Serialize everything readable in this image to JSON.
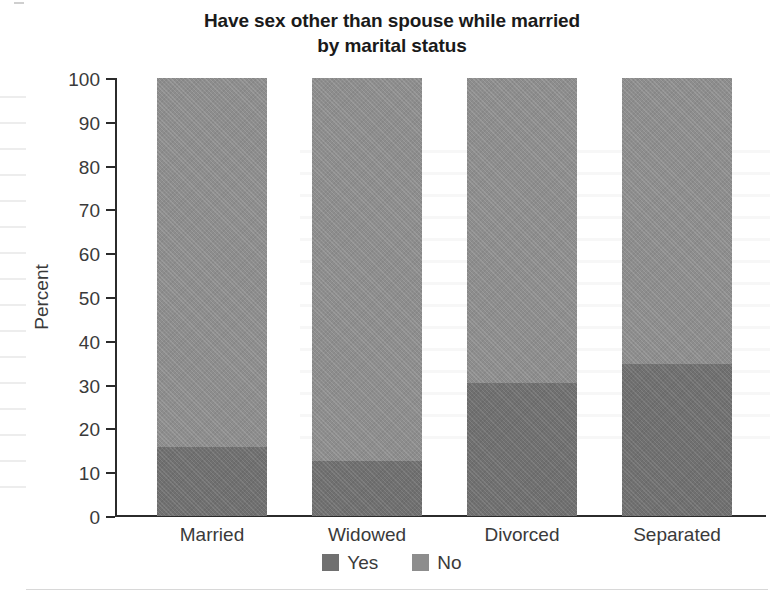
{
  "chart_data": {
    "type": "bar",
    "subtype": "stacked-100-percent",
    "title": "Have sex other than spouse while married by marital status",
    "title_lines": [
      "Have sex other than spouse while married",
      "by marital status"
    ],
    "xlabel": "",
    "ylabel": "Percent",
    "ylim": [
      0,
      100
    ],
    "ytick_step": 10,
    "yticks": [
      100,
      90,
      80,
      70,
      60,
      50,
      40,
      30,
      20,
      10,
      0
    ],
    "ytick_labels": [
      "100",
      "90",
      "80",
      "70",
      "60",
      "50",
      "40",
      "30",
      "20",
      "10",
      "0"
    ],
    "grid": false,
    "legend_position": "bottom-center",
    "categories": [
      "Married",
      "Widowed",
      "Divorced",
      "Separated"
    ],
    "series": [
      {
        "name": "Yes",
        "color": "#707070",
        "values": [
          15.8,
          12.6,
          30.4,
          34.7
        ]
      },
      {
        "name": "No",
        "color": "#8d8d8d",
        "values": [
          84.2,
          87.4,
          69.6,
          65.3
        ]
      }
    ]
  },
  "legend": {
    "items": [
      {
        "label": "Yes",
        "color": "#707070"
      },
      {
        "label": "No",
        "color": "#8d8d8d"
      }
    ]
  },
  "axis": {
    "y_title": "Percent"
  },
  "colors": {
    "yes": "#707070",
    "no": "#8d8d8d",
    "axis": "#2b2b2b",
    "text": "#3a3a3a",
    "title": "#1a1a1a",
    "background": "#ffffff"
  }
}
